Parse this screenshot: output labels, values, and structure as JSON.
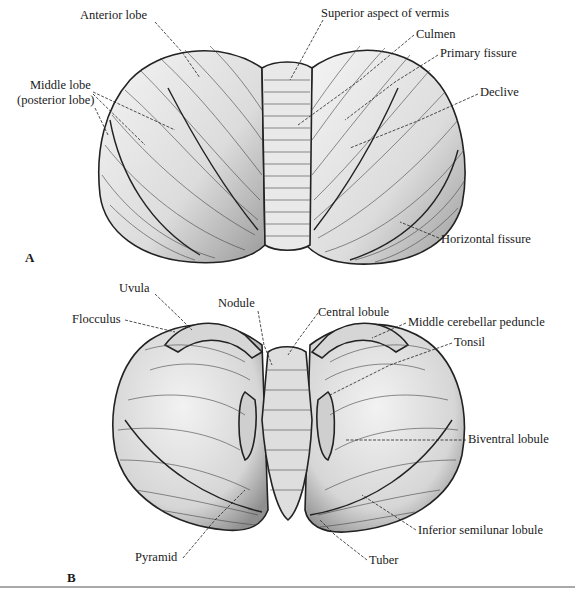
{
  "figure": {
    "panels": [
      {
        "id": "A",
        "letter": "A",
        "view": "superior",
        "labels": {
          "anterior_lobe": "Anterior lobe",
          "superior_vermis": "Superior aspect of vermis",
          "culmen": "Culmen",
          "primary_fissure": "Primary fissure",
          "middle_lobe_1": "Middle lobe",
          "middle_lobe_2": "(posterior lobe)",
          "declive": "Declive",
          "horizontal_fissure": "Horizontal fissure"
        }
      },
      {
        "id": "B",
        "letter": "B",
        "view": "inferior",
        "labels": {
          "uvula": "Uvula",
          "nodule": "Nodule",
          "central_lobule": "Central lobule",
          "flocculus": "Flocculus",
          "middle_cerebellar_peduncle": "Middle cerebellar peduncle",
          "tonsil": "Tonsil",
          "biventral_lobule": "Biventral lobule",
          "inferior_semilunar_lobule": "Inferior semilunar lobule",
          "pyramid": "Pyramid",
          "tuber": "Tuber"
        }
      }
    ]
  },
  "colors": {
    "ink": "#1a1a1a",
    "tissue": "#e6e6e6",
    "tissue_shade": "#bdbdbd",
    "background": "#ffffff"
  }
}
